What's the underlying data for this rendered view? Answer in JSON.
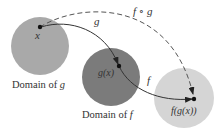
{
  "diagram": {
    "type": "function-composition",
    "colors": {
      "domain_g": "#a9a9a9",
      "domain_f": "#7b7b7b",
      "range_fg": "#d5d5d5",
      "arrow": "#333333",
      "dashed_arrow": "#555555",
      "text": "#333333"
    },
    "nodes": {
      "x": {
        "label": "x"
      },
      "gx": {
        "label": "g(x)"
      },
      "fgx": {
        "label": "f(g(x))"
      }
    },
    "regions": {
      "domain_g": {
        "label": "Domain of g",
        "label_prefix": "Domain of ",
        "label_var": "g"
      },
      "domain_f": {
        "label": "Domain of f",
        "label_prefix": "Domain of ",
        "label_var": "f"
      }
    },
    "arrows": {
      "g": {
        "label": "g",
        "from": "x",
        "to": "g(x)",
        "style": "solid"
      },
      "f": {
        "label": "f",
        "from": "g(x)",
        "to": "f(g(x))",
        "style": "solid"
      },
      "fog": {
        "label": "f ∘ g",
        "label_f": "f",
        "label_op": "∘",
        "label_g": "g",
        "from": "x",
        "to": "f(g(x))",
        "style": "dashed"
      }
    }
  }
}
